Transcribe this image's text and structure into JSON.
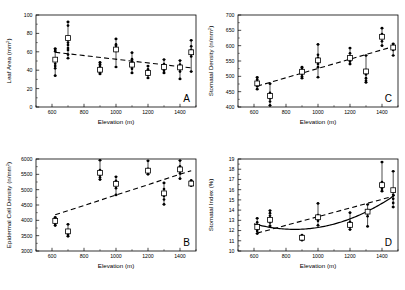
{
  "figure": {
    "background": "#ffffff",
    "ink": "#000000",
    "panels": [
      "A",
      "B",
      "C",
      "D"
    ]
  },
  "chart_data": [
    {
      "id": "A",
      "type": "scatter",
      "panel_letter": "A",
      "title": "",
      "xlabel": "Elevation (m)",
      "ylabel": "Leaf Area (mm²)",
      "ylabel_base": "Leaf Area (n/mm",
      "xlim": [
        500,
        1500
      ],
      "ylim": [
        0,
        100
      ],
      "xticks": [
        600,
        800,
        1000,
        1200,
        1400
      ],
      "yticks": [
        0,
        20,
        40,
        60,
        80,
        100
      ],
      "grid": false,
      "legend": "none",
      "fit": {
        "type": "line",
        "x": [
          620,
          1470
        ],
        "y": [
          59.5,
          42.5
        ],
        "style": "dashed"
      },
      "groups": [
        {
          "x": 620,
          "mean": 51.5,
          "lo": 34.0,
          "hi": 63.5,
          "points": [
            34.0,
            42.0,
            44.5,
            47.0,
            51.0,
            60.5,
            62.0,
            63.5
          ]
        },
        {
          "x": 700,
          "mean": 75.0,
          "lo": 53.0,
          "hi": 92.5,
          "points": [
            53.0,
            57.0,
            62.0,
            64.0,
            67.5,
            70.0,
            88.5,
            92.5
          ]
        },
        {
          "x": 900,
          "mean": 40.5,
          "lo": 36.0,
          "hi": 48.5,
          "points": [
            36.0,
            37.5,
            39.5,
            41.0,
            44.5,
            46.5,
            48.5
          ]
        },
        {
          "x": 1000,
          "mean": 62.5,
          "lo": 43.5,
          "hi": 74.0,
          "points": [
            43.5,
            61.0,
            64.0,
            66.5,
            68.0,
            74.0
          ]
        },
        {
          "x": 1100,
          "mean": 46.0,
          "lo": 37.0,
          "hi": 59.0,
          "points": [
            37.0,
            41.5,
            44.0,
            47.0,
            49.5,
            52.0,
            59.0
          ]
        },
        {
          "x": 1200,
          "mean": 37.0,
          "lo": 31.5,
          "hi": 44.5,
          "points": [
            31.5,
            34.5,
            36.0,
            38.5,
            41.0,
            44.5
          ]
        },
        {
          "x": 1300,
          "mean": 43.5,
          "lo": 37.0,
          "hi": 51.5,
          "points": [
            37.0,
            39.5,
            42.0,
            44.0,
            46.5,
            51.5
          ]
        },
        {
          "x": 1400,
          "mean": 43.0,
          "lo": 30.5,
          "hi": 50.5,
          "points": [
            30.5,
            38.5,
            41.0,
            43.5,
            46.0,
            50.5
          ]
        },
        {
          "x": 1470,
          "mean": 59.5,
          "lo": 38.5,
          "hi": 72.5,
          "points": [
            38.5,
            55.0,
            58.5,
            62.0,
            66.0,
            72.5
          ]
        }
      ]
    },
    {
      "id": "B",
      "type": "scatter",
      "panel_letter": "B",
      "title": "",
      "xlabel": "Elevation (m)",
      "ylabel": "Epidermal Cell Density (n/mm²)",
      "xlim": [
        500,
        1500
      ],
      "ylim": [
        3000,
        6000
      ],
      "xticks": [
        600,
        800,
        1000,
        1200,
        1400
      ],
      "yticks": [
        3000,
        3500,
        4000,
        4500,
        5000,
        5500,
        6000
      ],
      "grid": false,
      "legend": "none",
      "fit": {
        "type": "line",
        "x": [
          620,
          1470
        ],
        "y": [
          4180,
          5620
        ],
        "style": "dashed"
      },
      "groups": [
        {
          "x": 620,
          "mean": 3980,
          "lo": 3830,
          "hi": 4100,
          "points": [
            3830,
            3880,
            3950,
            4010,
            4060,
            4100
          ]
        },
        {
          "x": 700,
          "mean": 3640,
          "lo": 3480,
          "hi": 3870,
          "points": [
            3480,
            3530,
            3600,
            3680,
            3870
          ]
        },
        {
          "x": 900,
          "mean": 5550,
          "lo": 5330,
          "hi": 5960,
          "points": [
            5330,
            5400,
            5480,
            5560,
            5640,
            5960
          ]
        },
        {
          "x": 1000,
          "mean": 5190,
          "lo": 4830,
          "hi": 5420,
          "points": [
            4830,
            5050,
            5170,
            5290,
            5420
          ]
        },
        {
          "x": 1200,
          "mean": 5620,
          "lo": 5500,
          "hi": 5940,
          "points": [
            5500,
            5560,
            5620,
            5680,
            5940
          ]
        },
        {
          "x": 1300,
          "mean": 4880,
          "lo": 4520,
          "hi": 5220,
          "points": [
            4520,
            4680,
            4790,
            4900,
            5020,
            5220
          ]
        },
        {
          "x": 1400,
          "mean": 5660,
          "lo": 5360,
          "hi": 5950,
          "points": [
            5360,
            5530,
            5640,
            5760,
            5950
          ]
        },
        {
          "x": 1470,
          "mean": 5200,
          "lo": 5130,
          "hi": 5300,
          "points": [
            5130,
            5180,
            5230,
            5300
          ]
        }
      ]
    },
    {
      "id": "C",
      "type": "scatter",
      "panel_letter": "C",
      "title": "",
      "xlabel": "Elevation (m)",
      "ylabel": "Stomatal Density (n/mm²)",
      "xlim": [
        500,
        1500
      ],
      "ylim": [
        400,
        700
      ],
      "xticks": [
        600,
        800,
        1000,
        1200,
        1400
      ],
      "yticks": [
        400,
        450,
        500,
        550,
        600,
        650,
        700
      ],
      "grid": false,
      "legend": "none",
      "fit": {
        "type": "line",
        "x": [
          620,
          1470
        ],
        "y": [
          468,
          597
        ],
        "style": "dashed"
      },
      "groups": [
        {
          "x": 620,
          "mean": 477,
          "lo": 458,
          "hi": 497,
          "points": [
            458,
            468,
            474,
            483,
            490,
            497
          ]
        },
        {
          "x": 700,
          "mean": 436,
          "lo": 405,
          "hi": 476,
          "points": [
            405,
            418,
            428,
            437,
            446,
            476
          ]
        },
        {
          "x": 900,
          "mean": 515,
          "lo": 494,
          "hi": 530,
          "points": [
            494,
            500,
            508,
            516,
            524,
            530
          ]
        },
        {
          "x": 1000,
          "mean": 552,
          "lo": 497,
          "hi": 604,
          "points": [
            497,
            530,
            540,
            549,
            560,
            570,
            604
          ]
        },
        {
          "x": 1200,
          "mean": 560,
          "lo": 540,
          "hi": 592,
          "points": [
            540,
            548,
            556,
            564,
            575,
            592
          ]
        },
        {
          "x": 1300,
          "mean": 516,
          "lo": 480,
          "hi": 568,
          "points": [
            480,
            486,
            494,
            506,
            520,
            568
          ]
        },
        {
          "x": 1400,
          "mean": 629,
          "lo": 600,
          "hi": 657,
          "points": [
            600,
            614,
            626,
            638,
            657
          ]
        },
        {
          "x": 1470,
          "mean": 594,
          "lo": 568,
          "hi": 606,
          "points": [
            568,
            586,
            594,
            601,
            606
          ]
        }
      ]
    },
    {
      "id": "D",
      "type": "scatter",
      "panel_letter": "D",
      "title": "",
      "xlabel": "Elevation (m)",
      "ylabel": "Stomatal Index (%)",
      "xlim": [
        500,
        1500
      ],
      "ylim": [
        10,
        19
      ],
      "xticks": [
        600,
        800,
        1000,
        1200,
        1400
      ],
      "yticks": [
        10,
        11,
        12,
        13,
        14,
        15,
        16,
        17,
        18,
        19
      ],
      "grid": false,
      "legend": "none",
      "fit": {
        "type": "line",
        "x": [
          620,
          1470
        ],
        "y": [
          11.75,
          15.35
        ],
        "style": "dashed"
      },
      "fit2": {
        "type": "quadratic",
        "style": "solid",
        "a": 8.5e-06,
        "b": -0.0145,
        "c": 18.3,
        "x_start": 600,
        "x_end": 1480
      },
      "groups": [
        {
          "x": 620,
          "mean": 12.35,
          "lo": 11.7,
          "hi": 13.2,
          "points": [
            11.7,
            11.95,
            12.2,
            12.5,
            12.8,
            13.2
          ]
        },
        {
          "x": 700,
          "mean": 13.05,
          "lo": 12.45,
          "hi": 13.95,
          "points": [
            12.45,
            12.8,
            13.1,
            13.45,
            13.7,
            13.95
          ]
        },
        {
          "x": 900,
          "mean": 11.3,
          "lo": 11.05,
          "hi": 11.55,
          "points": [
            11.05,
            11.2,
            11.35,
            11.55
          ]
        },
        {
          "x": 1000,
          "mean": 13.3,
          "lo": 12.5,
          "hi": 14.65,
          "points": [
            12.5,
            12.95,
            13.2,
            13.5,
            14.65
          ]
        },
        {
          "x": 1200,
          "mean": 12.55,
          "lo": 12.1,
          "hi": 13.75,
          "points": [
            12.1,
            12.35,
            12.6,
            12.85,
            13.75
          ]
        },
        {
          "x": 1310,
          "mean": 13.85,
          "lo": 12.4,
          "hi": 14.55,
          "points": [
            12.4,
            13.4,
            13.7,
            14.0,
            14.55
          ]
        },
        {
          "x": 1400,
          "mean": 16.45,
          "lo": 15.85,
          "hi": 18.7,
          "points": [
            15.85,
            16.1,
            16.45,
            16.75,
            18.7
          ]
        },
        {
          "x": 1470,
          "mean": 15.95,
          "lo": 14.3,
          "hi": 17.8,
          "points": [
            14.3,
            14.7,
            15.1,
            15.5,
            15.95,
            17.8
          ]
        }
      ]
    }
  ]
}
